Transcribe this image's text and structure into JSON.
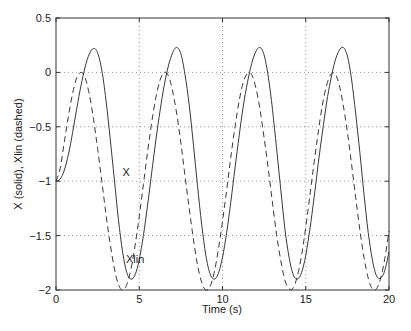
{
  "chart_data": {
    "type": "line",
    "title": "",
    "xlabel": "Time (s)",
    "ylabel": "X (solid),  Xlin (dashed)",
    "xlim": [
      0,
      20
    ],
    "ylim": [
      -2,
      0.5
    ],
    "xticks": [
      0,
      5,
      10,
      15,
      20
    ],
    "yticks": [
      0.5,
      0,
      -0.5,
      -1,
      -1.5,
      -2
    ],
    "xtick_labels": [
      "0",
      "5",
      "10",
      "15",
      "20"
    ],
    "ytick_labels": [
      "0.5",
      "0",
      "−0.5",
      "−1",
      "−1.5",
      "−2"
    ],
    "grid": true,
    "annotations": [
      {
        "text": "X",
        "x": 4.0,
        "y": -0.95
      },
      {
        "text": "Xlin",
        "x": 4.2,
        "y": -1.75
      }
    ],
    "series": [
      {
        "name": "X",
        "style": "solid",
        "x": [
          0,
          0.25,
          0.5,
          0.75,
          1,
          1.25,
          1.5,
          1.75,
          2,
          2.25,
          2.5,
          2.75,
          3,
          3.25,
          3.5,
          3.75,
          4,
          4.25,
          4.5,
          4.75,
          5,
          5.25,
          5.5,
          5.75,
          6,
          6.25,
          6.5,
          6.75,
          7,
          7.25,
          7.5,
          7.75,
          8,
          8.25,
          8.5,
          8.75,
          9,
          9.25,
          9.5,
          9.75,
          10,
          10.25,
          10.5,
          10.75,
          11,
          11.25,
          11.5,
          11.75,
          12,
          12.25,
          12.5,
          12.75,
          13,
          13.25,
          13.5,
          13.75,
          14,
          14.25,
          14.5,
          14.75,
          15,
          15.25,
          15.5,
          15.75,
          16,
          16.25,
          16.5,
          16.75,
          17,
          17.25,
          17.5,
          17.75,
          18,
          18.25,
          18.5,
          18.75,
          19,
          19.25,
          19.5,
          19.75,
          20
        ],
        "y": [
          -1.0,
          -0.98,
          -0.9,
          -0.75,
          -0.55,
          -0.33,
          -0.12,
          0.05,
          0.17,
          0.22,
          0.18,
          0.02,
          -0.25,
          -0.6,
          -0.98,
          -1.35,
          -1.65,
          -1.84,
          -1.9,
          -1.86,
          -1.72,
          -1.5,
          -1.22,
          -0.92,
          -0.62,
          -0.35,
          -0.12,
          0.06,
          0.18,
          0.23,
          0.17,
          -0.02,
          -0.3,
          -0.66,
          -1.04,
          -1.4,
          -1.68,
          -1.85,
          -1.9,
          -1.85,
          -1.7,
          -1.47,
          -1.19,
          -0.88,
          -0.58,
          -0.31,
          -0.09,
          0.08,
          0.19,
          0.23,
          0.16,
          -0.04,
          -0.34,
          -0.7,
          -1.08,
          -1.44,
          -1.7,
          -1.86,
          -1.9,
          -1.84,
          -1.68,
          -1.44,
          -1.15,
          -0.84,
          -0.55,
          -0.28,
          -0.07,
          0.1,
          0.2,
          0.23,
          0.15,
          -0.06,
          -0.38,
          -0.74,
          -1.12,
          -1.47,
          -1.72,
          -1.87,
          -1.89,
          -1.82,
          -1.65
        ]
      },
      {
        "name": "Xlin",
        "style": "dashed",
        "x": [
          0,
          0.25,
          0.5,
          0.75,
          1,
          1.25,
          1.5,
          1.75,
          2,
          2.25,
          2.5,
          2.75,
          3,
          3.25,
          3.5,
          3.75,
          4,
          4.25,
          4.5,
          4.75,
          5,
          5.25,
          5.5,
          5.75,
          6,
          6.25,
          6.5,
          6.75,
          7,
          7.25,
          7.5,
          7.75,
          8,
          8.25,
          8.5,
          8.75,
          9,
          9.25,
          9.5,
          9.75,
          10,
          10.25,
          10.5,
          10.75,
          11,
          11.25,
          11.5,
          11.75,
          12,
          12.25,
          12.5,
          12.75,
          13,
          13.25,
          13.5,
          13.75,
          14,
          14.25,
          14.5,
          14.75,
          15,
          15.25,
          15.5,
          15.75,
          16,
          16.25,
          16.5,
          16.75,
          17,
          17.25,
          17.5,
          17.75,
          18,
          18.25,
          18.5,
          18.75,
          19,
          19.25,
          19.5,
          19.75,
          20
        ],
        "y": [
          -1.0,
          -0.88,
          -0.64,
          -0.4,
          -0.19,
          -0.05,
          0.0,
          -0.05,
          -0.2,
          -0.43,
          -0.7,
          -1.0,
          -1.3,
          -1.57,
          -1.8,
          -1.95,
          -2.0,
          -1.95,
          -1.81,
          -1.59,
          -1.32,
          -1.03,
          -0.73,
          -0.46,
          -0.23,
          -0.07,
          0.0,
          -0.03,
          -0.17,
          -0.38,
          -0.65,
          -0.95,
          -1.25,
          -1.53,
          -1.77,
          -1.93,
          -2.0,
          -1.97,
          -1.84,
          -1.63,
          -1.37,
          -1.08,
          -0.78,
          -0.5,
          -0.26,
          -0.09,
          -0.01,
          -0.02,
          -0.14,
          -0.34,
          -0.6,
          -0.89,
          -1.2,
          -1.49,
          -1.73,
          -1.91,
          -1.99,
          -1.98,
          -1.87,
          -1.68,
          -1.42,
          -1.13,
          -0.83,
          -0.55,
          -0.3,
          -0.12,
          -0.02,
          -0.01,
          -0.11,
          -0.3,
          -0.55,
          -0.84,
          -1.15,
          -1.45,
          -1.7,
          -1.89,
          -1.99,
          -1.99,
          -1.89,
          -1.71,
          -1.46
        ]
      }
    ]
  }
}
